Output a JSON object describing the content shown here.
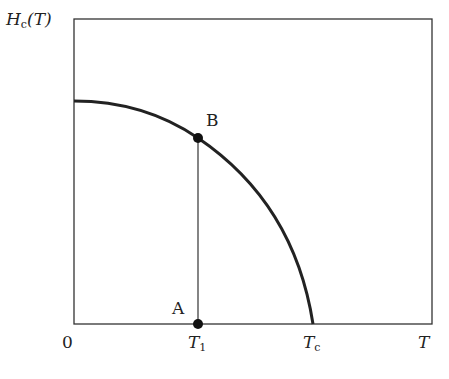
{
  "diagram": {
    "type": "phase-diagram",
    "y_axis_label": {
      "symbol": "H",
      "subscript": "c",
      "argument": "(T)"
    },
    "x_axis_label": "T",
    "origin_label": "0",
    "x_ticks": [
      {
        "symbol": "T",
        "subscript": "1"
      },
      {
        "symbol": "T",
        "subscript": "c"
      }
    ],
    "points": [
      {
        "label": "A",
        "description": "on T-axis at T1"
      },
      {
        "label": "B",
        "description": "on Hc(T) curve at T1"
      }
    ],
    "curve": "critical field Hc(T), decreasing from maximum at T=0 to zero at Tc",
    "colors": {
      "line": "#222222",
      "background": "#ffffff"
    }
  }
}
